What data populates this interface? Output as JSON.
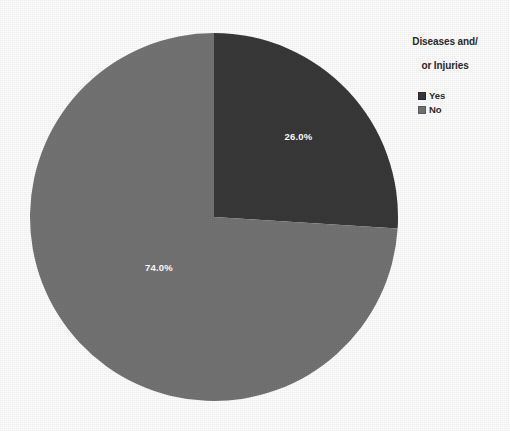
{
  "chart_data": {
    "type": "pie",
    "title": "",
    "categories": [
      "Yes",
      "No"
    ],
    "values": [
      26.0,
      74.0
    ],
    "labels": [
      "26.0%",
      "74.0%"
    ],
    "colors": [
      "#383838",
      "#737373"
    ],
    "start_angle_deg": 0,
    "direction": "clockwise",
    "legend_position": "top-right",
    "grid": false,
    "xlabel": "",
    "ylabel": "",
    "slices": [
      {
        "name": "Yes",
        "value": 26.0,
        "label": "26.0%",
        "color": "#383838",
        "label_color": "#ffffff"
      },
      {
        "name": "No",
        "value": 74.0,
        "label": "74.0%",
        "color": "#737373",
        "label_color": "#ffffff"
      }
    ]
  },
  "legend": {
    "title": "Diseases and/\nor Injuries",
    "title_line_1": "Diseases and/",
    "title_line_2": "or Injuries",
    "items": [
      {
        "label": "Yes",
        "color": "#383838"
      },
      {
        "label": "No",
        "color": "#737373"
      }
    ]
  },
  "figure": {
    "background": "#fdfdfd",
    "text_color": "#2b2b2b"
  }
}
